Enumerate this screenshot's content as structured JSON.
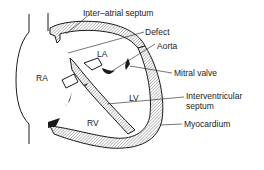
{
  "diagram": {
    "chambers": {
      "ra": "RA",
      "la": "LA",
      "lv": "LV",
      "rv": "RV"
    },
    "labels": {
      "inter_atrial_septum": "Inter–atrial septum",
      "defect": "Defect",
      "aorta": "Aorta",
      "mitral_valve": "Mitral valve",
      "interventricular_septum_line1": "Interventricular",
      "interventricular_septum_line2": "septum",
      "myocardium": "Myocardium"
    },
    "colors": {
      "stroke": "#1a1a1a",
      "background": "#ffffff",
      "hatch": "#9a9a9a"
    }
  }
}
